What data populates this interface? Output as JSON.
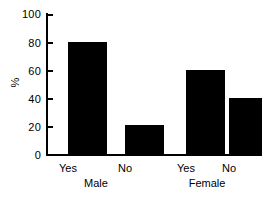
{
  "chart_data": {
    "type": "bar",
    "title": "",
    "xlabel": "",
    "ylabel": "%",
    "ylim": [
      0,
      100
    ],
    "yticks": [
      0,
      20,
      40,
      60,
      80,
      100
    ],
    "grid": false,
    "legend": false,
    "bar_color": "#000000",
    "axis_color": "#000000",
    "categories": [
      "Yes",
      "No",
      "Yes",
      "No"
    ],
    "values": [
      80,
      21.5,
      60,
      40.5
    ],
    "groups": [
      {
        "label": "Male",
        "bars": [
          {
            "category": "Yes",
            "value": 80
          },
          {
            "category": "No",
            "value": 21.5
          }
        ]
      },
      {
        "label": "Female",
        "bars": [
          {
            "category": "Yes",
            "value": 60
          },
          {
            "category": "No",
            "value": 40.5
          }
        ]
      }
    ]
  },
  "ticks": {
    "t0": "0",
    "t20": "20",
    "t40": "40",
    "t60": "60",
    "t80": "80",
    "t100": "100"
  },
  "labels": {
    "yaxis": "%",
    "male_yes": "Yes",
    "male_no": "No",
    "female_yes": "Yes",
    "female_no": "No",
    "male": "Male",
    "female": "Female"
  }
}
